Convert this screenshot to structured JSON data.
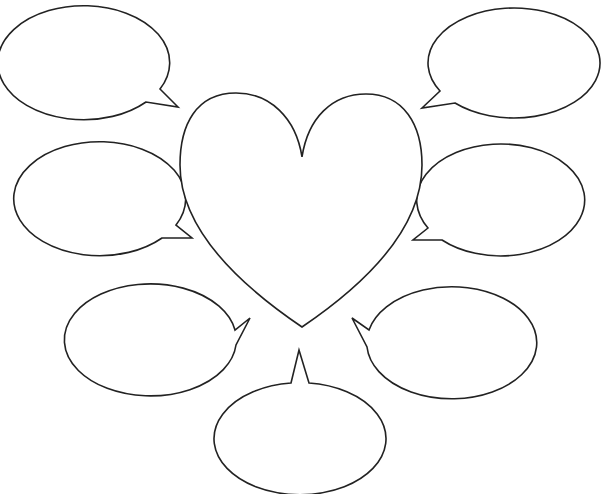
{
  "diagram": {
    "title": "",
    "center": {
      "shape": "heart",
      "label": ""
    },
    "bubbles": [
      {
        "id": "top-left",
        "label": ""
      },
      {
        "id": "top-right",
        "label": ""
      },
      {
        "id": "middle-left",
        "label": ""
      },
      {
        "id": "middle-right",
        "label": ""
      },
      {
        "id": "bottom-left",
        "label": ""
      },
      {
        "id": "bottom-right",
        "label": ""
      },
      {
        "id": "bottom-center",
        "label": ""
      }
    ],
    "stroke_color": "#222222",
    "fill_color": "#ffffff"
  }
}
